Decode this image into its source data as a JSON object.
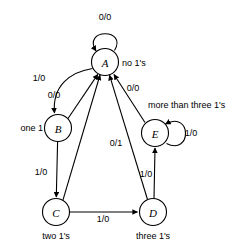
{
  "diagram": {
    "colors": {
      "background": "#ffffff",
      "stroke": "#000000",
      "node_fill": "#ffffff"
    },
    "states": [
      {
        "id": "A",
        "label": "A",
        "description": "no 1's",
        "cx": 105,
        "cy": 62,
        "r": 13.5,
        "desc_x": 122,
        "desc_y": 63,
        "desc_anchor": "start"
      },
      {
        "id": "B",
        "label": "B",
        "description": "one 1",
        "cx": 58,
        "cy": 128,
        "r": 13.5,
        "desc_x": 43,
        "desc_y": 128,
        "desc_anchor": "end"
      },
      {
        "id": "C",
        "label": "C",
        "description": "two 1's",
        "cx": 56,
        "cy": 212,
        "r": 13.5,
        "desc_x": 56,
        "desc_y": 236,
        "desc_anchor": "middle"
      },
      {
        "id": "D",
        "label": "D",
        "description": "three 1's",
        "cx": 153,
        "cy": 212,
        "r": 13.5,
        "desc_x": 153,
        "desc_y": 236,
        "desc_anchor": "middle"
      },
      {
        "id": "E",
        "label": "E",
        "description": "more than three 1's",
        "cx": 155,
        "cy": 133,
        "r": 13.5,
        "desc_x": 148,
        "desc_y": 105,
        "desc_anchor": "start"
      }
    ],
    "transitions": [
      {
        "from": "A",
        "to": "A",
        "label": "0/0",
        "label_x": 105,
        "label_y": 17,
        "kind": "self-loop-top"
      },
      {
        "from": "A",
        "to": "B",
        "label": "1/0",
        "label_x": 39,
        "label_y": 78,
        "kind": "curve"
      },
      {
        "from": "B",
        "to": "A",
        "label": "0/0",
        "label_x": 54,
        "label_y": 95,
        "kind": "line"
      },
      {
        "from": "B",
        "to": "C",
        "label": "1/0",
        "label_x": 41,
        "label_y": 172,
        "kind": "line"
      },
      {
        "from": "C",
        "to": "A",
        "label": "",
        "label_x": 0,
        "label_y": 0,
        "kind": "line"
      },
      {
        "from": "C",
        "to": "D",
        "label": "1/0",
        "label_x": 103,
        "label_y": 219,
        "kind": "line"
      },
      {
        "from": "D",
        "to": "A",
        "label": "0/1",
        "label_x": 116,
        "label_y": 143,
        "kind": "line"
      },
      {
        "from": "D",
        "to": "E",
        "label": "1/0",
        "label_x": 146,
        "label_y": 174,
        "kind": "line"
      },
      {
        "from": "E",
        "to": "A",
        "label": "0/0",
        "label_x": 133,
        "label_y": 88,
        "kind": "line"
      },
      {
        "from": "E",
        "to": "E",
        "label": "1/0",
        "label_x": 191,
        "label_y": 133,
        "kind": "self-loop-right"
      }
    ]
  }
}
